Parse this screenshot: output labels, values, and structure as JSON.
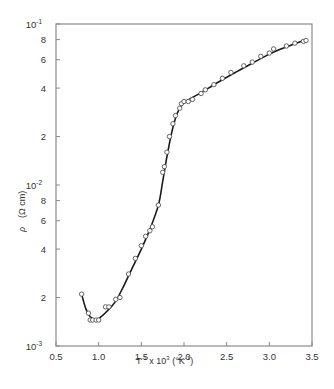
{
  "chart_data": {
    "type": "scatter",
    "title": "",
    "xlabel": "T^-1 x 10^3 (°K^-1)",
    "ylabel": "ρ (Ω cm)",
    "x_scale": "linear",
    "y_scale": "log",
    "xlim": [
      0.5,
      3.5
    ],
    "ylim": [
      0.001,
      0.1
    ],
    "grid": false,
    "legend": null,
    "x_ticks": [
      0.5,
      1.0,
      1.5,
      2.0,
      2.5,
      3.0,
      3.5
    ],
    "x_tick_labels": [
      "0.5",
      "1.0",
      "1.5",
      "2.0",
      "2.5",
      "3.0",
      "3.5"
    ],
    "y_ticks": [
      {
        "value": 0.1,
        "label": "10",
        "exp": "-1"
      },
      {
        "value": 0.08,
        "label": "8"
      },
      {
        "value": 0.06,
        "label": "6"
      },
      {
        "value": 0.04,
        "label": "4"
      },
      {
        "value": 0.02,
        "label": "2"
      },
      {
        "value": 0.01,
        "label": "10",
        "exp": "-2"
      },
      {
        "value": 0.008,
        "label": "8"
      },
      {
        "value": 0.006,
        "label": "6"
      },
      {
        "value": 0.004,
        "label": "4"
      },
      {
        "value": 0.002,
        "label": "2"
      },
      {
        "value": 0.001,
        "label": "10",
        "exp": "-3"
      }
    ],
    "series": [
      {
        "name": "measured",
        "marker": "open-circle",
        "x": [
          0.8,
          0.88,
          0.9,
          0.93,
          0.97,
          1.0,
          1.08,
          1.12,
          1.2,
          1.25,
          1.35,
          1.43,
          1.5,
          1.55,
          1.6,
          1.63,
          1.7,
          1.75,
          1.77,
          1.8,
          1.83,
          1.87,
          1.9,
          1.95,
          1.97,
          2.0,
          2.05,
          2.1,
          2.2,
          2.25,
          2.35,
          2.45,
          2.55,
          2.7,
          2.8,
          2.9,
          3.0,
          3.05,
          3.2,
          3.3,
          3.4,
          3.43
        ],
        "y": [
          0.0021,
          0.0016,
          0.00145,
          0.00145,
          0.00145,
          0.00145,
          0.00175,
          0.00175,
          0.00195,
          0.002,
          0.0028,
          0.0035,
          0.0042,
          0.0048,
          0.0052,
          0.0055,
          0.0075,
          0.012,
          0.013,
          0.016,
          0.02,
          0.024,
          0.027,
          0.03,
          0.032,
          0.033,
          0.033,
          0.034,
          0.037,
          0.039,
          0.042,
          0.046,
          0.05,
          0.055,
          0.058,
          0.063,
          0.066,
          0.07,
          0.073,
          0.076,
          0.078,
          0.079
        ]
      },
      {
        "name": "fit",
        "marker": "line",
        "x": [
          0.8,
          0.85,
          0.9,
          0.95,
          1.0,
          1.1,
          1.2,
          1.3,
          1.4,
          1.5,
          1.6,
          1.7,
          1.75,
          1.8,
          1.85,
          1.9,
          1.95,
          2.0,
          2.1,
          2.2,
          2.4,
          2.6,
          2.8,
          3.0,
          3.2,
          3.43
        ],
        "y": [
          0.0021,
          0.0017,
          0.00152,
          0.00147,
          0.00148,
          0.00165,
          0.0019,
          0.0024,
          0.0031,
          0.004,
          0.0053,
          0.0075,
          0.0105,
          0.015,
          0.0205,
          0.026,
          0.03,
          0.0325,
          0.035,
          0.0375,
          0.0435,
          0.05,
          0.057,
          0.065,
          0.072,
          0.08
        ]
      }
    ]
  },
  "labels": {
    "xlabel_base": "T",
    "xlabel_exp1": "-1",
    "xlabel_mid": " x 10",
    "xlabel_exp2": "3",
    "xlabel_unit": " (°K",
    "xlabel_unit_exp": "-1",
    "xlabel_close": ")",
    "ylabel_symbol": "ρ",
    "ylabel_unit": "(Ω cm)"
  },
  "colors": {
    "axis": "#8a8a8a",
    "curve": "#1a1a1a",
    "marker": "#555555",
    "text": "#333333"
  }
}
